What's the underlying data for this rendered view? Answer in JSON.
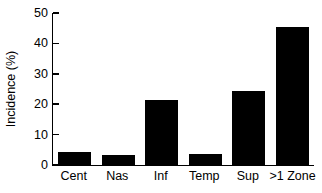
{
  "chart_data": {
    "type": "bar",
    "title": "",
    "subtitle": "",
    "xlabel": "",
    "ylabel": "Incidence (%)",
    "categories": [
      "Cent",
      "Nas",
      "Inf",
      "Temp",
      "Sup",
      ">1 Zone"
    ],
    "values": [
      4.3,
      3.3,
      21.4,
      3.5,
      24.3,
      45.5
    ],
    "ylim": [
      0,
      50
    ],
    "yticks": [
      0,
      10,
      20,
      30,
      40,
      50
    ],
    "ytick_labels": [
      "0",
      "10",
      "20",
      "30",
      "40",
      "50"
    ],
    "xlim_categories": 6,
    "grid": false,
    "legend": false,
    "legend_position": "none",
    "bar_color": "#000000",
    "axis_color": "#000000",
    "background_color": "#ffffff",
    "series": [
      {
        "name": "Incidence",
        "values": [
          4.3,
          3.3,
          21.4,
          3.5,
          24.3,
          45.5
        ]
      }
    ],
    "annotations": []
  }
}
